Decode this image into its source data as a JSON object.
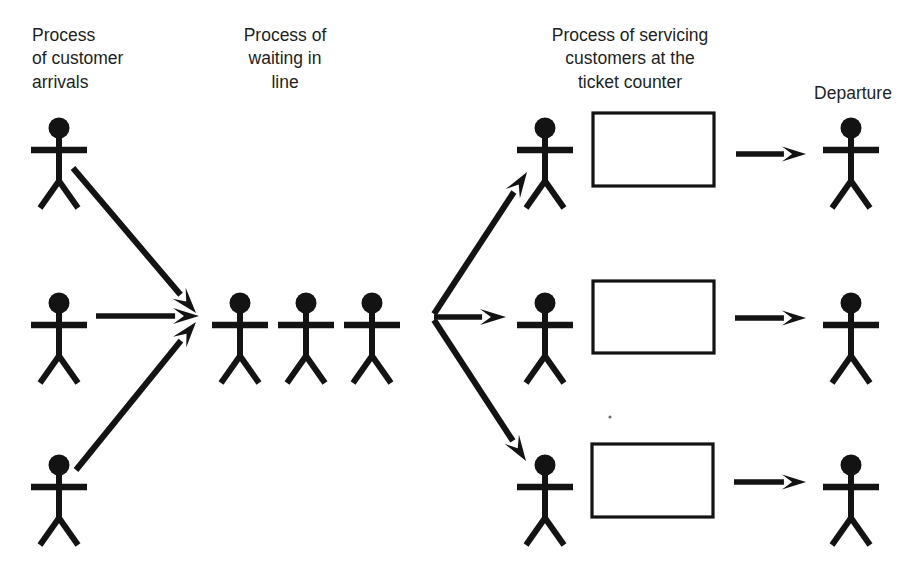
{
  "diagram": {
    "type": "flow-diagram",
    "canvas": {
      "width": 917,
      "height": 573
    },
    "ink_color": "#141313",
    "background_color": "#ffffff",
    "text_color": "#211f1f"
  },
  "headers": [
    {
      "id": "arrivals",
      "lines": [
        "Process",
        "of customer",
        "arrivals"
      ],
      "x": 32,
      "y": 28,
      "anchor": "start"
    },
    {
      "id": "waiting",
      "lines": [
        "Process of",
        "waiting in",
        "line"
      ],
      "x": 285,
      "y": 28,
      "anchor": "middle"
    },
    {
      "id": "servicing",
      "lines": [
        "Process of servicing",
        "customers at the",
        "ticket counter"
      ],
      "x": 630,
      "y": 28,
      "anchor": "middle"
    },
    {
      "id": "departure",
      "lines": [
        "Departure"
      ],
      "x": 853,
      "y": 86,
      "anchor": "middle"
    }
  ],
  "figures": [
    {
      "id": "arrival-top",
      "group": "arrivals",
      "cx": 59,
      "cy": 128
    },
    {
      "id": "arrival-middle",
      "group": "arrivals",
      "cx": 59,
      "cy": 303
    },
    {
      "id": "arrival-bottom",
      "group": "arrivals",
      "cx": 59,
      "cy": 465
    },
    {
      "id": "queue-1",
      "group": "queue",
      "cx": 240,
      "cy": 303
    },
    {
      "id": "queue-2",
      "group": "queue",
      "cx": 306,
      "cy": 303
    },
    {
      "id": "queue-3",
      "group": "queue",
      "cx": 372,
      "cy": 303
    },
    {
      "id": "server-top",
      "group": "servers",
      "cx": 545,
      "cy": 128
    },
    {
      "id": "server-middle",
      "group": "servers",
      "cx": 545,
      "cy": 303
    },
    {
      "id": "server-bottom",
      "group": "servers",
      "cx": 545,
      "cy": 465
    },
    {
      "id": "departure-top",
      "group": "departures",
      "cx": 851,
      "cy": 128
    },
    {
      "id": "departure-middle",
      "group": "departures",
      "cx": 851,
      "cy": 303
    },
    {
      "id": "departure-bottom",
      "group": "departures",
      "cx": 851,
      "cy": 465
    }
  ],
  "figure_geometry": {
    "head_radius": 10.5,
    "head_offset_y": 0,
    "arm_y_offset": 22,
    "arm_half_width": 28,
    "arm_thickness": 6.5,
    "torso_thickness": 6.0,
    "torso_bottom_offset": 53,
    "leg_spread": 19,
    "leg_bottom_offset": 80,
    "leg_thickness": 6.0
  },
  "counters": [
    {
      "id": "counter-top",
      "x": 593,
      "y": 113,
      "width": 121,
      "height": 73
    },
    {
      "id": "counter-middle",
      "x": 593,
      "y": 281,
      "width": 121,
      "height": 72
    },
    {
      "id": "counter-bottom",
      "x": 592,
      "y": 444,
      "width": 121,
      "height": 73
    }
  ],
  "arrows": [
    {
      "id": "arrival-top-to-queue",
      "group": "converge",
      "x1": 73,
      "y1": 168,
      "x2": 196,
      "y2": 313,
      "thickness": 6.0,
      "head_length": 26,
      "head_width": 17
    },
    {
      "id": "arrival-middle-to-queue",
      "group": "converge",
      "x1": 96,
      "y1": 316,
      "x2": 199,
      "y2": 316,
      "thickness": 5.5,
      "head_length": 26,
      "head_width": 16
    },
    {
      "id": "arrival-bottom-to-queue",
      "group": "converge",
      "x1": 76,
      "y1": 470,
      "x2": 196,
      "y2": 322,
      "thickness": 6.0,
      "head_length": 26,
      "head_width": 17
    },
    {
      "id": "queue-to-server-top",
      "group": "diverge",
      "x1": 434,
      "y1": 314,
      "x2": 527,
      "y2": 172,
      "thickness": 6.0,
      "head_length": 26,
      "head_width": 17
    },
    {
      "id": "queue-to-server-middle",
      "group": "diverge",
      "x1": 434,
      "y1": 317,
      "x2": 506,
      "y2": 317,
      "thickness": 5.5,
      "head_length": 26,
      "head_width": 16
    },
    {
      "id": "queue-to-server-bottom",
      "group": "diverge",
      "x1": 434,
      "y1": 320,
      "x2": 526,
      "y2": 461,
      "thickness": 6.0,
      "head_length": 26,
      "head_width": 17
    },
    {
      "id": "counter-top-to-departure",
      "group": "exit",
      "x1": 736,
      "y1": 154,
      "x2": 806,
      "y2": 154,
      "thickness": 5.5,
      "head_length": 24,
      "head_width": 15
    },
    {
      "id": "counter-middle-to-departure",
      "group": "exit",
      "x1": 735,
      "y1": 318,
      "x2": 806,
      "y2": 318,
      "thickness": 5.5,
      "head_length": 24,
      "head_width": 15
    },
    {
      "id": "counter-bottom-to-departure",
      "group": "exit",
      "x1": 734,
      "y1": 482,
      "x2": 806,
      "y2": 482,
      "thickness": 5.5,
      "head_length": 24,
      "head_width": 15
    }
  ],
  "specks": [
    {
      "x": 610,
      "y": 417,
      "r": 1.6
    }
  ]
}
